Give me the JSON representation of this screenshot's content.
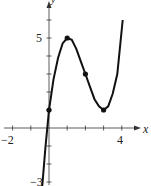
{
  "chart_data": {
    "type": "line",
    "title": "",
    "xlabel": "x",
    "ylabel": "y",
    "xlim": [
      -2.2,
      5.1
    ],
    "ylim": [
      -3.1,
      7
    ],
    "x_tick_labels": [
      "-2",
      "4"
    ],
    "y_tick_labels": [
      "5",
      "-3"
    ],
    "x_ticks": [
      -2,
      -1,
      1,
      2,
      3,
      4
    ],
    "y_ticks": [
      -3,
      -2,
      -1,
      1,
      2,
      3,
      4,
      5,
      6
    ],
    "grid": false,
    "series": [
      {
        "name": "f(x)",
        "x": [
          -0.4,
          -0.2,
          0,
          0.25,
          0.5,
          0.75,
          1,
          1.25,
          1.5,
          1.75,
          2,
          2.25,
          2.5,
          2.75,
          3,
          3.25,
          3.5,
          3.75,
          4.05
        ],
        "y": [
          -3.6,
          -1.1,
          1,
          2.7,
          3.9,
          4.7,
          5,
          4.9,
          4.4,
          3.7,
          3,
          2.3,
          1.6,
          1.2,
          1,
          1.2,
          1.9,
          3.0,
          6.0
        ]
      }
    ],
    "marked_points": [
      {
        "x": 0,
        "y": 1
      },
      {
        "x": 1,
        "y": 5
      },
      {
        "x": 2,
        "y": 3
      },
      {
        "x": 3,
        "y": 1
      }
    ]
  },
  "labels": {
    "x_axis": "x",
    "y_axis": "y",
    "x_neg2": "−2",
    "x_4": "4",
    "y_5": "5",
    "y_neg3": "−3"
  }
}
